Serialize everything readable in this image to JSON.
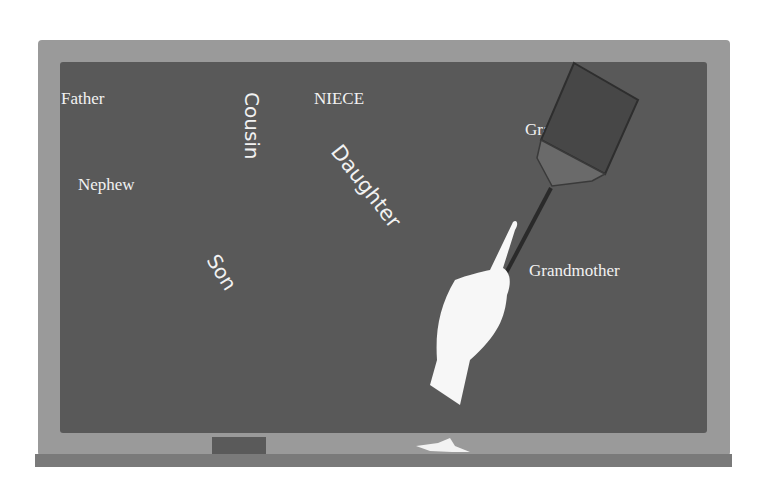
{
  "scene": {
    "description": "Chalkboard with family vocabulary words and a hand holding a fly swatter",
    "colors": {
      "frame": "#9a9a9a",
      "board": "#595959",
      "chalk_text": "#f2f2f2",
      "tray": "#7a7a7a"
    }
  },
  "words": {
    "father": "Father",
    "nephew": "Nephew",
    "cousin": "Cousin",
    "niece": "NIECE",
    "daughter": "Daughter",
    "son": "Son",
    "grandfather": "Grandfather",
    "grandmother": "Grandmother"
  },
  "icons": {
    "swatter": "fly-swatter-icon",
    "hand": "pointing-hand-icon",
    "chalk": "chalk-icon",
    "eraser": "eraser-icon"
  }
}
